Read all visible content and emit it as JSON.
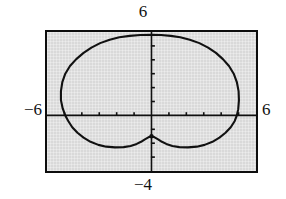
{
  "screen": {
    "kind": "graphing-calculator-viewport",
    "background_color": "#d9d9d9",
    "border_color": "#0d0d0d",
    "curve_color": "#111111",
    "axis_color": "#111111"
  },
  "labels": {
    "top": "6",
    "bottom": "−4",
    "left": "−6",
    "right": "6"
  },
  "chart_data": {
    "type": "line",
    "title": "",
    "xlabel": "",
    "ylabel": "",
    "grid": false,
    "legend": null,
    "window": {
      "xmin": -6,
      "xmax": 6,
      "ymin": -4,
      "ymax": 6,
      "xscl": 1,
      "yscl": 1
    },
    "xlim": [
      -6,
      6
    ],
    "ylim": [
      -4,
      6
    ],
    "xticks": [
      -5,
      -4,
      -3,
      -2,
      -1,
      1,
      2,
      3,
      4,
      5
    ],
    "yticks": [
      -3,
      -2,
      -1,
      1,
      2,
      3,
      4,
      5
    ],
    "axis_tick_count_x": 10,
    "axis_tick_count_y": 8,
    "curve_description": "cardioid-like closed polar curve, cusp at bottom on the y-axis",
    "features": {
      "left_x_intercept": -5.2,
      "right_x_intercept": 5.0,
      "top_y_value": 5.8,
      "cusp_point": [
        0,
        -1.5
      ],
      "bottom_min_y": -2.3
    },
    "series": [
      {
        "name": "r = 2 - 3 sin(theta) style cardioid",
        "closed": true,
        "points": [
          [
            0.0,
            5.8
          ],
          [
            0.55,
            5.78
          ],
          [
            1.1,
            5.72
          ],
          [
            1.65,
            5.62
          ],
          [
            2.2,
            5.45
          ],
          [
            2.75,
            5.2
          ],
          [
            3.25,
            4.88
          ],
          [
            3.7,
            4.5
          ],
          [
            4.1,
            4.05
          ],
          [
            4.45,
            3.55
          ],
          [
            4.72,
            3.0
          ],
          [
            4.9,
            2.4
          ],
          [
            5.0,
            1.75
          ],
          [
            5.02,
            1.1
          ],
          [
            4.98,
            0.45
          ],
          [
            4.9,
            0.0
          ],
          [
            4.78,
            -0.4
          ],
          [
            4.55,
            -0.85
          ],
          [
            4.25,
            -1.25
          ],
          [
            3.9,
            -1.6
          ],
          [
            3.5,
            -1.9
          ],
          [
            3.05,
            -2.12
          ],
          [
            2.6,
            -2.25
          ],
          [
            2.1,
            -2.3
          ],
          [
            1.6,
            -2.28
          ],
          [
            1.2,
            -2.2
          ],
          [
            0.85,
            -2.05
          ],
          [
            0.6,
            -1.9
          ],
          [
            0.38,
            -1.72
          ],
          [
            0.18,
            -1.58
          ],
          [
            0.0,
            -1.5
          ],
          [
            -0.18,
            -1.58
          ],
          [
            -0.38,
            -1.72
          ],
          [
            -0.6,
            -1.9
          ],
          [
            -0.85,
            -2.05
          ],
          [
            -1.2,
            -2.2
          ],
          [
            -1.6,
            -2.28
          ],
          [
            -2.1,
            -2.3
          ],
          [
            -2.6,
            -2.25
          ],
          [
            -3.05,
            -2.12
          ],
          [
            -3.5,
            -1.9
          ],
          [
            -3.9,
            -1.6
          ],
          [
            -4.25,
            -1.25
          ],
          [
            -4.55,
            -0.85
          ],
          [
            -4.78,
            -0.4
          ],
          [
            -4.95,
            0.0
          ],
          [
            -5.1,
            0.5
          ],
          [
            -5.2,
            1.1
          ],
          [
            -5.2,
            1.75
          ],
          [
            -5.12,
            2.4
          ],
          [
            -4.95,
            3.0
          ],
          [
            -4.68,
            3.55
          ],
          [
            -4.32,
            4.05
          ],
          [
            -3.9,
            4.5
          ],
          [
            -3.45,
            4.88
          ],
          [
            -2.95,
            5.2
          ],
          [
            -2.4,
            5.45
          ],
          [
            -1.85,
            5.62
          ],
          [
            -1.25,
            5.72
          ],
          [
            -0.65,
            5.78
          ],
          [
            0.0,
            5.8
          ]
        ]
      }
    ]
  }
}
